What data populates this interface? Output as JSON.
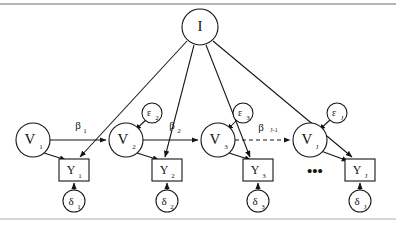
{
  "figure": {
    "type": "path-diagram",
    "rules": {
      "top_rule": true,
      "bottom_rule": true,
      "color": "#555555"
    },
    "colors": {
      "stroke": "#141414",
      "fill": "#ffffff",
      "background": "#ffffff",
      "rule": "#666666"
    }
  },
  "nodes": {
    "intercept": {
      "label": "I",
      "shape": "circle",
      "cx": 200,
      "cy": 27,
      "r": 18
    },
    "latent": [
      {
        "label": "V",
        "sub": "1",
        "shape": "circle",
        "cx": 33,
        "cy": 140,
        "r": 17
      },
      {
        "label": "V",
        "sub": "2",
        "shape": "circle",
        "cx": 126,
        "cy": 140,
        "r": 17
      },
      {
        "label": "V",
        "sub": "3",
        "shape": "circle",
        "cx": 218,
        "cy": 140,
        "r": 17
      },
      {
        "label": "V",
        "sub": "J",
        "shape": "circle",
        "cx": 310,
        "cy": 140,
        "r": 17
      }
    ],
    "observed": [
      {
        "label": "Y",
        "sub": "1",
        "shape": "rect",
        "cx": 74,
        "cy": 170,
        "w": 30,
        "h": 22
      },
      {
        "label": "Y",
        "sub": "2",
        "shape": "rect",
        "cx": 167,
        "cy": 170,
        "w": 30,
        "h": 22
      },
      {
        "label": "Y",
        "sub": "3",
        "shape": "rect",
        "cx": 258,
        "cy": 170,
        "w": 30,
        "h": 22
      },
      {
        "label": "Y",
        "sub": "J",
        "shape": "rect",
        "cx": 360,
        "cy": 170,
        "w": 30,
        "h": 22
      }
    ],
    "disturbance": [
      {
        "label": "δ",
        "sub": "1",
        "shape": "circle",
        "cx": 74,
        "cy": 201,
        "r": 11
      },
      {
        "label": "δ",
        "sub": "2",
        "shape": "circle",
        "cx": 167,
        "cy": 201,
        "r": 11
      },
      {
        "label": "δ",
        "sub": "3",
        "shape": "circle",
        "cx": 258,
        "cy": 201,
        "r": 11
      },
      {
        "label": "δ",
        "sub": "J",
        "shape": "circle",
        "cx": 360,
        "cy": 201,
        "r": 11
      }
    ],
    "error": [
      {
        "label": "ε",
        "sub": "2",
        "shape": "circle",
        "cx": 152,
        "cy": 113,
        "r": 10
      },
      {
        "label": "ε",
        "sub": "3",
        "shape": "circle",
        "cx": 243,
        "cy": 113,
        "r": 10
      },
      {
        "label": "ε",
        "sub": "J",
        "shape": "circle",
        "cx": 337,
        "cy": 113,
        "r": 10
      }
    ]
  },
  "edge_labels": {
    "beta1": {
      "text": "β",
      "sub": "1",
      "x": 78,
      "y": 126
    },
    "beta2": {
      "text": "β",
      "sub": "2",
      "x": 172,
      "y": 126
    },
    "betaJm1": {
      "text": "β",
      "sub": "J-1",
      "x": 265,
      "y": 128
    }
  },
  "ellipsis": {
    "text": "•••",
    "x": 315,
    "y": 172
  },
  "edges": [
    {
      "from": "V1",
      "to": "V2",
      "style": "solid",
      "label": "β1"
    },
    {
      "from": "V2",
      "to": "V3",
      "style": "solid",
      "label": "β2"
    },
    {
      "from": "V3",
      "to": "VJ",
      "style": "dashed",
      "label": "βJ-1"
    },
    {
      "from": "V1",
      "to": "Y1",
      "style": "solid"
    },
    {
      "from": "V2",
      "to": "Y2",
      "style": "solid"
    },
    {
      "from": "V3",
      "to": "Y3",
      "style": "solid"
    },
    {
      "from": "VJ",
      "to": "YJ",
      "style": "solid"
    },
    {
      "from": "I",
      "to": "Y1",
      "style": "solid"
    },
    {
      "from": "I",
      "to": "Y2",
      "style": "solid"
    },
    {
      "from": "I",
      "to": "Y3",
      "style": "solid"
    },
    {
      "from": "I",
      "to": "YJ",
      "style": "solid"
    },
    {
      "from": "ε2",
      "to": "V2",
      "style": "solid"
    },
    {
      "from": "ε3",
      "to": "V3",
      "style": "solid"
    },
    {
      "from": "εJ",
      "to": "VJ",
      "style": "solid"
    },
    {
      "from": "δ1",
      "to": "Y1",
      "style": "solid"
    },
    {
      "from": "δ2",
      "to": "Y2",
      "style": "solid"
    },
    {
      "from": "δ3",
      "to": "Y3",
      "style": "solid"
    },
    {
      "from": "δJ",
      "to": "YJ",
      "style": "solid"
    }
  ]
}
